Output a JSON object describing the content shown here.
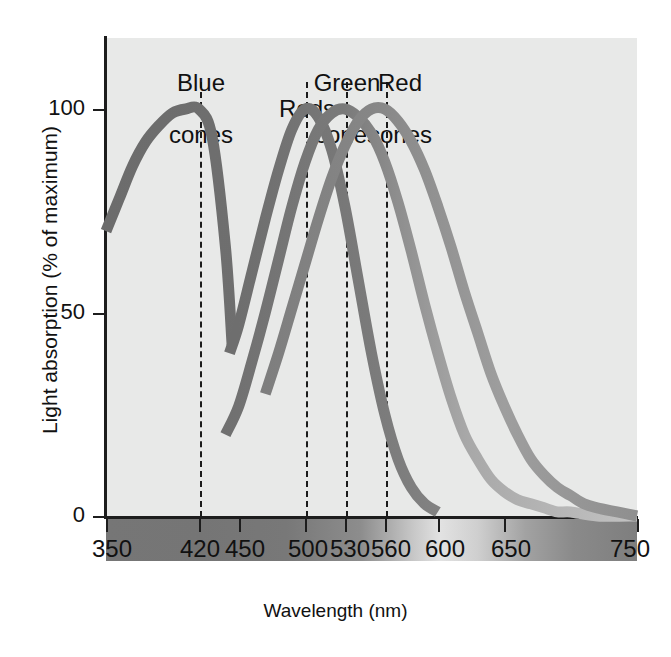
{
  "chart_data": {
    "type": "line",
    "title": "",
    "xlabel": "Wavelength (nm)",
    "ylabel": "Light absorption (% of maximum)",
    "xlim": [
      350,
      750
    ],
    "ylim": [
      0,
      110
    ],
    "xticks": [
      350,
      420,
      450,
      500,
      530,
      560,
      600,
      650,
      750
    ],
    "xticklabels": [
      "350",
      "420",
      "450",
      "500",
      "530",
      "560",
      "600",
      "650",
      "750"
    ],
    "yticks": [
      0,
      50,
      100
    ],
    "yticklabels": [
      "0",
      "50",
      "100"
    ],
    "grid": false,
    "legend_position": "inline-callouts",
    "annotations": [
      {
        "label": "Blue\ncones",
        "peak_nm": 420,
        "line_top_nm": 420
      },
      {
        "label": "Rods",
        "peak_nm": 500,
        "line_top_nm": 500
      },
      {
        "label": "Green\ncones",
        "peak_nm": 530,
        "line_top_nm": 530
      },
      {
        "label": "Red\ncones",
        "peak_nm": 560,
        "line_top_nm": 560
      }
    ],
    "series": [
      {
        "name": "Blue cones",
        "peak_nm": 420,
        "x": [
          350,
          360,
          370,
          380,
          390,
          400,
          410,
          420,
          430,
          440,
          445
        ],
        "values": [
          70,
          78,
          86,
          92,
          96,
          99,
          100,
          100,
          93,
          66,
          42
        ]
      },
      {
        "name": "Rods",
        "peak_nm": 500,
        "x": [
          443,
          450,
          460,
          470,
          480,
          490,
          500,
          510,
          520,
          530,
          540,
          550,
          560,
          570,
          580,
          590,
          600
        ],
        "values": [
          40,
          47,
          60,
          73,
          85,
          95,
          100,
          98,
          90,
          76,
          58,
          40,
          25,
          14,
          7,
          3,
          1
        ]
      },
      {
        "name": "Green cones",
        "peak_nm": 530,
        "x": [
          440,
          450,
          460,
          470,
          480,
          490,
          500,
          510,
          520,
          530,
          540,
          550,
          560,
          570,
          580,
          590,
          600,
          610,
          620,
          630,
          640,
          650,
          660,
          670,
          680,
          690,
          700,
          720,
          750
        ],
        "values": [
          20,
          27,
          38,
          50,
          63,
          76,
          87,
          95,
          99,
          100,
          98,
          94,
          87,
          77,
          65,
          52,
          40,
          29,
          20,
          14,
          9,
          6,
          4,
          3,
          2,
          1,
          1,
          0,
          0
        ]
      },
      {
        "name": "Red cones",
        "peak_nm": 560,
        "x": [
          470,
          480,
          490,
          500,
          510,
          520,
          530,
          540,
          550,
          560,
          570,
          580,
          590,
          600,
          610,
          620,
          630,
          640,
          650,
          660,
          670,
          680,
          690,
          700,
          710,
          720,
          735,
          750
        ],
        "values": [
          30,
          40,
          51,
          62,
          73,
          83,
          91,
          97,
          100,
          100,
          97,
          92,
          85,
          76,
          66,
          55,
          45,
          35,
          27,
          20,
          14,
          10,
          7,
          5,
          3,
          2,
          1,
          0
        ]
      }
    ]
  },
  "axes": {
    "y_title": "Light absorption (% of maximum)",
    "x_title": "Wavelength (nm)",
    "y_ticks": [
      {
        "label": "100",
        "value": 100
      },
      {
        "label": "50",
        "value": 50
      },
      {
        "label": "0",
        "value": 0
      }
    ],
    "x_ticks": [
      {
        "label": "350",
        "value": 350
      },
      {
        "label": "420",
        "value": 420
      },
      {
        "label": "450",
        "value": 450
      },
      {
        "label": "500",
        "value": 500
      },
      {
        "label": "530",
        "value": 530
      },
      {
        "label": "560",
        "value": 560
      },
      {
        "label": "600",
        "value": 600
      },
      {
        "label": "650",
        "value": 650
      },
      {
        "label": "750",
        "value": 750
      }
    ]
  },
  "callouts": [
    {
      "id": "blue-cones",
      "line1": "Blue",
      "line2": "cones",
      "nm": 420,
      "single_line": false
    },
    {
      "id": "rods",
      "line1": "Rods",
      "line2": "",
      "nm": 500,
      "single_line": true
    },
    {
      "id": "green-cones",
      "line1": "Green",
      "line2": "cones",
      "nm": 530,
      "single_line": false
    },
    {
      "id": "red-cones",
      "line1": "Red",
      "line2": "cones",
      "nm": 560,
      "single_line": false
    }
  ],
  "colors": {
    "plot_background": "#e8e9e8",
    "axis": "#1d1d1d",
    "curve_dark": "#6f6f6f",
    "curve_mid": "#8c8c8c",
    "curve_light": "#b4b4b4",
    "text": "#111111"
  },
  "caption": {
    "partial_text": ""
  }
}
